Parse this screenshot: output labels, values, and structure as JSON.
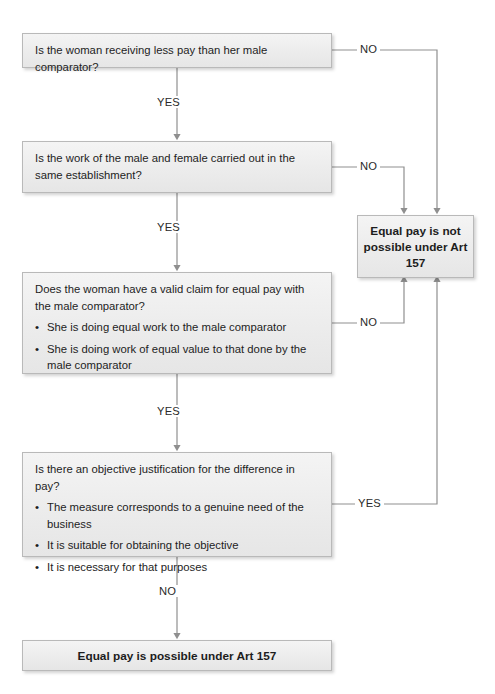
{
  "diagram": {
    "accent_line_color": "#8f8f8f",
    "node_fill_color": "#ececec",
    "node_border_color": "#b9b9b9",
    "text_color": "#1d1d1d"
  },
  "nodes": {
    "q1": {
      "id": "q1",
      "question": "Is the woman receiving less pay than her male comparator?",
      "bullets": []
    },
    "q2": {
      "id": "q2",
      "question": "Is the work of the male and female carried out in the same establishment?",
      "bullets": []
    },
    "q3": {
      "id": "q3",
      "question": "Does the woman have a valid claim for equal pay with the male comparator?",
      "bullets": [
        "She is doing equal work to the male comparator",
        "She is doing work of equal value to that done by the male comparator"
      ]
    },
    "q4": {
      "id": "q4",
      "question": "Is there an objective justification for the difference in pay?",
      "bullets": [
        "The measure corresponds to a genuine need of the business",
        "It is suitable for obtaining the objective",
        "It is necessary for that purposes"
      ]
    },
    "not_possible": {
      "id": "not-possible",
      "text": "Equal pay is not possible under Art 157"
    },
    "possible": {
      "id": "possible",
      "text": "Equal pay is possible under Art 157"
    }
  },
  "edge_labels": {
    "q1_no": "NO",
    "q1_yes": "YES",
    "q2_no": "NO",
    "q2_yes": "YES",
    "q3_no": "NO",
    "q3_yes": "YES",
    "q4_yes": "YES",
    "q4_no": "NO"
  }
}
